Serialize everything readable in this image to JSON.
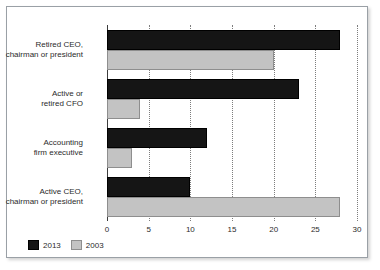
{
  "chart_data": {
    "type": "bar",
    "orientation": "horizontal",
    "title": "",
    "subtitle": "",
    "xlabel": "",
    "ylabel": "",
    "xlim": [
      0,
      30
    ],
    "ticks": [
      "0",
      "5",
      "10",
      "15",
      "20",
      "25",
      "30"
    ],
    "tick_values": [
      0,
      5,
      10,
      15,
      20,
      25,
      30
    ],
    "grid": true,
    "grid_style": "dotted vertical",
    "legend_position": "bottom-left",
    "categories": [
      "Retired CEO,\nchairman or president",
      "Active or\nretired CFO",
      "Accounting\nfirm executive",
      "Active CEO,\nchairman or president"
    ],
    "series": [
      {
        "name": "2013",
        "color": "#151515",
        "values": [
          28,
          23,
          12,
          10
        ]
      },
      {
        "name": "2003",
        "color": "#c3c3c3",
        "values": [
          20,
          4,
          3,
          28
        ]
      }
    ]
  },
  "legend": {
    "items": [
      {
        "label": "2013",
        "color": "#151515"
      },
      {
        "label": "2003",
        "color": "#c3c3c3"
      }
    ]
  },
  "axis": {
    "tick_labels": [
      "0",
      "5",
      "10",
      "15",
      "20",
      "25",
      "30"
    ]
  },
  "colors": {
    "series_2013": "#151515",
    "series_2003": "#c3c3c3",
    "frame_border": "#9aa0a6",
    "axis": "#3c3c3c",
    "grid": "#7d7d7d",
    "text": "#2b2b2b",
    "background": "#ffffff"
  }
}
